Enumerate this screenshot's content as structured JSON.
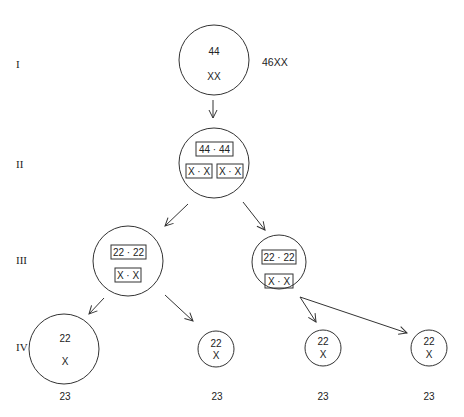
{
  "levels": {
    "I": "I",
    "II": "II",
    "III": "III",
    "IV": "IV"
  },
  "level1": {
    "autosomes": "44",
    "sex": "XX",
    "karyotype": "46XX"
  },
  "level2": {
    "autosomes": "44 · 44",
    "sex_left": "X · X",
    "sex_right": "X · X"
  },
  "level3": {
    "left": {
      "autosomes": "22 · 22",
      "sex": "X · X"
    },
    "right": {
      "autosomes": "22 · 22",
      "sex": "X · X"
    }
  },
  "level4": [
    {
      "autosomes": "22",
      "sex": "X",
      "count": "23"
    },
    {
      "autosomes": "22",
      "sex": "X",
      "count": "23"
    },
    {
      "autosomes": "22",
      "sex": "X",
      "count": "23"
    },
    {
      "autosomes": "22",
      "sex": "X",
      "count": "23"
    }
  ]
}
